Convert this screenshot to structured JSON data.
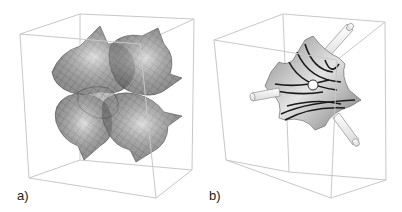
{
  "figure": {
    "panels": [
      {
        "id": "a",
        "label": "a)",
        "description": "Periodic minimal surface mesh repeated 2x2x2 inside a wireframe unit cube",
        "elements": [
          "bounding-cube",
          "wireframe-surface-mesh"
        ]
      },
      {
        "id": "b",
        "label": "b)",
        "description": "Single surface patch with dark curvature lines, a central hole and three cylindrical rods along body diagonals inside a wireframe cube",
        "elements": [
          "bounding-cube",
          "surface-patch",
          "contour-lines",
          "center-hole",
          "rod-upper-right",
          "rod-left",
          "rod-lower-right"
        ]
      }
    ],
    "colors": {
      "cube_edge": "#c8c8c8",
      "surface_fill": "#a8a8a8",
      "surface_light": "#d8d8d8",
      "mesh_line": "#6e6e6e",
      "contour_line": "#1a1a1a",
      "rod_fill": "#eeeeee",
      "rod_edge": "#9a9a9a"
    }
  }
}
